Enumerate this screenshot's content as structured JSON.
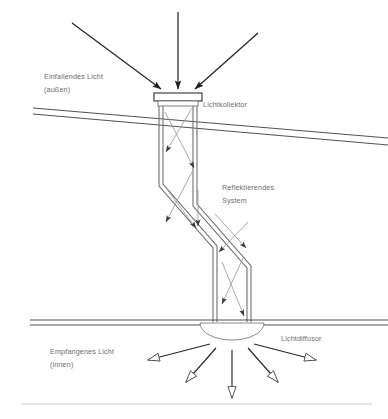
{
  "diagram": {
    "background_color": "#ffffff",
    "line_color": "#2b2b2b",
    "structure_color": "#6f6f6f",
    "ray_color": "#8a8a8a",
    "label_color": "#6d6d6d",
    "labels": {
      "incoming_light_line1": "Einfallendes Licht",
      "incoming_light_line2": "(außen)",
      "collector": "Lichtkollektor",
      "reflective_system_line1": "Reflektierendes",
      "reflective_system_line2": "System",
      "received_light_line1": "Empfangenes Licht",
      "received_light_line2": "(innen)",
      "diffusor": "Lichtdiffusor"
    },
    "components": {
      "roof": "sloped-roof-double-line",
      "ceiling": "horizontal-ceiling-double-line",
      "floor": "horizontal-floor-line",
      "collector_cap": "rectangular-light-collector",
      "tube": "zigzag-reflective-light-tube",
      "diffusor_dome": "semicircular-light-diffusor"
    },
    "counts": {
      "incoming_arrows": 3,
      "outgoing_arrows": 5,
      "internal_reflection_arrows": 8
    }
  }
}
